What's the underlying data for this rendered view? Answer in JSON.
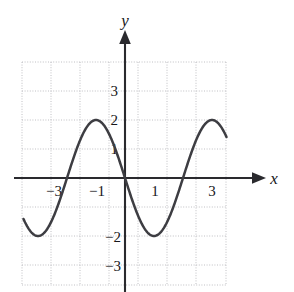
{
  "figure": {
    "kind": "cartesian-graph",
    "background_color": "#ffffff",
    "curve_color": "#3d3d42",
    "axis_color": "#2a2a2e",
    "grid_color": "#b9b9bd"
  },
  "axes": {
    "x_axis_label": "x",
    "y_axis_label": "y",
    "x_tick_labels": [
      "−3",
      "−1",
      "1",
      "3"
    ],
    "y_tick_labels": [
      "3",
      "2",
      "1",
      "−2",
      "−3"
    ]
  },
  "chart_data": {
    "type": "line",
    "title": "",
    "xlabel": "x",
    "ylabel": "y",
    "xlim": [
      -3.55,
      3.5
    ],
    "ylim": [
      -4,
      4
    ],
    "grid": true,
    "legend": "none",
    "x_ticks": [
      -3,
      -1,
      1,
      3
    ],
    "x_tick_labels": [
      "−3",
      "−1",
      "1",
      "3"
    ],
    "y_ticks": [
      3,
      2,
      1,
      -2,
      -3
    ],
    "y_tick_labels": [
      "3",
      "2",
      "1",
      "−2",
      "−3"
    ],
    "series": [
      {
        "name": "y = −2 sin(πx/2)",
        "amplitude": 2,
        "period": 4,
        "x": [
          -3.5,
          -3.25,
          -3,
          -2.75,
          -2.5,
          -2.25,
          -2,
          -1.75,
          -1.5,
          -1.25,
          -1,
          -0.75,
          -0.5,
          -0.25,
          0,
          0.25,
          0.5,
          0.75,
          1,
          1.25,
          1.5,
          1.75,
          2,
          2.25,
          2.5,
          2.75,
          3,
          3.25,
          3.5
        ],
        "values": [
          0,
          1.41,
          2,
          1.41,
          0,
          -1.41,
          -2,
          -1.41,
          0,
          1.41,
          2,
          1.41,
          0,
          -1.41,
          -2,
          -1.41,
          0,
          1.41,
          2,
          1.41,
          0,
          -1.41,
          -2,
          -1.41,
          0,
          1.41,
          2,
          1.41,
          0
        ]
      }
    ],
    "key_points": {
      "maxima": [
        {
          "x": -3,
          "y": 2
        },
        {
          "x": 1,
          "y": 2
        }
      ],
      "minima": [
        {
          "x": -1,
          "y": -2
        },
        {
          "x": 3,
          "y": -2
        }
      ],
      "zeros": [
        -3.5,
        -2,
        0,
        2,
        3.5
      ]
    }
  },
  "geometry": {
    "grid_left": 22,
    "grid_right": 226,
    "grid_top": 62,
    "grid_bottom": 285,
    "origin_x": 125,
    "origin_y": 178,
    "unit_px": 29
  }
}
